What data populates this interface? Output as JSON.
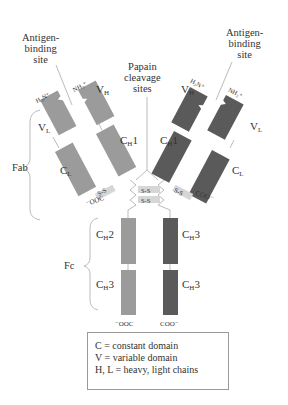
{
  "colors": {
    "light_chain_left": "#9b9b9b",
    "heavy_chain_left": "#9b9b9b",
    "heavy_chain_right": "#5a5a5a",
    "light_chain_right": "#5a5a5a",
    "lines": "#aaaaaa",
    "text": "#333333"
  },
  "labels": {
    "antigen_binding_left": [
      "Antigen-",
      "binding",
      "site"
    ],
    "antigen_binding_right": [
      "Antigen-",
      "binding",
      "site"
    ],
    "papain": [
      "Papain",
      "cleavage",
      "sites"
    ],
    "fab": "Fab",
    "fc": "Fc",
    "h3n_left": "H₃N⁺",
    "nh3_left": "NH₃⁺",
    "h3n_right": "H₃N⁺",
    "nh3_right": "NH₃⁺",
    "ooc_left_light": "⁻OOC",
    "coo_right_light": "COO⁻",
    "ooc_bottom_left": "⁻OOC",
    "coo_bottom_right": "COO⁻",
    "ss": "S-S"
  },
  "domains": {
    "left": {
      "vl": {
        "main": "V",
        "sub": "L"
      },
      "vh": {
        "main": "V",
        "sub": "H"
      },
      "cl": {
        "main": "C",
        "sub": "L"
      },
      "ch1": {
        "main": "C",
        "sub": "H",
        "suffix": "1"
      }
    },
    "right": {
      "vh": {
        "main": "V",
        "sub": "H"
      },
      "vl": {
        "main": "V",
        "sub": "L"
      },
      "ch1": {
        "main": "C",
        "sub": "H",
        "suffix": "1"
      },
      "cl": {
        "main": "C",
        "sub": "L"
      }
    },
    "fc": {
      "left_top": {
        "main": "C",
        "sub": "H",
        "suffix": "2"
      },
      "left_bottom": {
        "main": "C",
        "sub": "H",
        "suffix": "3"
      },
      "right_top": {
        "main": "C",
        "sub": "H",
        "suffix": "3"
      },
      "right_bottom": {
        "main": "C",
        "sub": "H",
        "suffix": "3"
      }
    }
  },
  "legend": {
    "lines": [
      "C = constant domain",
      "V = variable domain",
      "H, L = heavy, light chains"
    ]
  }
}
